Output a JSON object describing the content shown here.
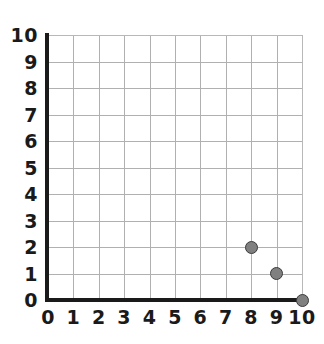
{
  "chart_data": {
    "type": "scatter",
    "title": "",
    "xlabel": "",
    "ylabel": "",
    "xlim": [
      0,
      10
    ],
    "ylim": [
      0,
      10
    ],
    "grid": true,
    "legend": null,
    "x_ticks": [
      "0",
      "1",
      "2",
      "3",
      "4",
      "5",
      "6",
      "7",
      "8",
      "9",
      "10"
    ],
    "y_ticks": [
      "0",
      "1",
      "2",
      "3",
      "4",
      "5",
      "6",
      "7",
      "8",
      "9",
      "10"
    ],
    "x_tick_values": [
      0,
      1,
      2,
      3,
      4,
      5,
      6,
      7,
      8,
      9,
      10
    ],
    "y_tick_values": [
      0,
      1,
      2,
      3,
      4,
      5,
      6,
      7,
      8,
      9,
      10
    ],
    "points": [
      {
        "x": 8,
        "y": 2,
        "label": "(8, 2)"
      },
      {
        "x": 9,
        "y": 1,
        "label": "(9, 1)"
      },
      {
        "x": 10,
        "y": 0,
        "label": "(10, 0)"
      }
    ],
    "marker": {
      "shape": "circle",
      "fill_color": "#808080",
      "edge_color": "#3a3a3a",
      "size_px": 13
    },
    "style": {
      "background_color": "#ffffff",
      "grid_color": "#b0b0b0",
      "axis_color": "#1a1a1a",
      "label_color": "#1a1a1a"
    }
  }
}
